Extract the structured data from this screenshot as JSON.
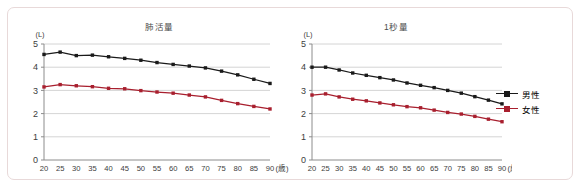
{
  "figure": {
    "frame_border_color": "#e8d9d9",
    "background": "#ffffff"
  },
  "legend": {
    "position": "right",
    "items": [
      {
        "label": "男性",
        "color": "#1a1a1a",
        "marker": "square"
      },
      {
        "label": "女性",
        "color": "#a81f2e",
        "marker": "square"
      }
    ]
  },
  "axis": {
    "y_unit": "(L)",
    "x_unit": "(歳)",
    "y_ticks": [
      "5",
      "4",
      "3",
      "2",
      "1",
      "0"
    ],
    "x_ticks": [
      "20",
      "25",
      "30",
      "35",
      "40",
      "45",
      "50",
      "55",
      "60",
      "65",
      "70",
      "75",
      "80",
      "85",
      "90"
    ]
  },
  "chart_data": [
    {
      "type": "line",
      "title": "肺活量",
      "xlabel": "(歳)",
      "ylabel": "(L)",
      "xlim": [
        20,
        90
      ],
      "ylim": [
        0,
        5
      ],
      "grid": true,
      "legend_position": "right",
      "x": [
        20,
        25,
        30,
        35,
        40,
        45,
        50,
        55,
        60,
        65,
        70,
        75,
        80,
        85,
        90
      ],
      "series": [
        {
          "name": "男性",
          "color": "#1a1a1a",
          "values": [
            4.55,
            4.65,
            4.5,
            4.52,
            4.45,
            4.38,
            4.3,
            4.2,
            4.12,
            4.05,
            3.97,
            3.83,
            3.67,
            3.48,
            3.3
          ]
        },
        {
          "name": "女性",
          "color": "#a81f2e",
          "values": [
            3.15,
            3.25,
            3.2,
            3.16,
            3.09,
            3.07,
            2.99,
            2.93,
            2.88,
            2.8,
            2.72,
            2.57,
            2.43,
            2.31,
            2.2
          ]
        }
      ]
    },
    {
      "type": "line",
      "title": "1秒量",
      "xlabel": "(歳)",
      "ylabel": "(L)",
      "xlim": [
        20,
        90
      ],
      "ylim": [
        0,
        5
      ],
      "grid": true,
      "legend_position": "right",
      "x": [
        20,
        25,
        30,
        35,
        40,
        45,
        50,
        55,
        60,
        65,
        70,
        75,
        80,
        85,
        90
      ],
      "series": [
        {
          "name": "男性",
          "color": "#1a1a1a",
          "values": [
            4.0,
            4.0,
            3.88,
            3.75,
            3.65,
            3.55,
            3.45,
            3.32,
            3.22,
            3.12,
            3.0,
            2.88,
            2.73,
            2.58,
            2.42
          ]
        },
        {
          "name": "女性",
          "color": "#a81f2e",
          "values": [
            2.8,
            2.85,
            2.72,
            2.62,
            2.55,
            2.46,
            2.38,
            2.3,
            2.25,
            2.15,
            2.05,
            1.98,
            1.88,
            1.76,
            1.65
          ]
        }
      ]
    }
  ]
}
